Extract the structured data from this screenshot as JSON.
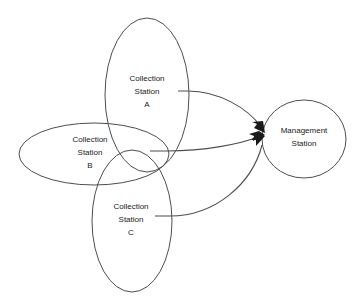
{
  "diagram": {
    "type": "network-topology-diagram",
    "background_color": "#ffffff",
    "stroke_color": "#4d4d4d",
    "arrow_color": "#1a1a1a",
    "text_color": "#1a1a1a",
    "nodes": [
      {
        "id": "collection-station-a",
        "shape": "ellipse",
        "label_line1": "Collection",
        "label_line2": "Station",
        "label_line3": "A",
        "cx": 147,
        "cy": 95,
        "rx": 42,
        "ry": 77
      },
      {
        "id": "collection-station-b",
        "shape": "ellipse",
        "label_line1": "Collection",
        "label_line2": "Station",
        "label_line3": "B",
        "cx": 94,
        "cy": 154,
        "rx": 75,
        "ry": 31
      },
      {
        "id": "collection-station-c",
        "shape": "ellipse",
        "label_line1": "Collection",
        "label_line2": "Station",
        "label_line3": "C",
        "cx": 132,
        "cy": 221,
        "rx": 40,
        "ry": 71
      },
      {
        "id": "management-station",
        "shape": "circle",
        "label_line1": "Management",
        "label_line2": "Station",
        "label_line3": "",
        "cx": 304,
        "cy": 139,
        "rx": 42,
        "ry": 39
      }
    ],
    "edges": [
      {
        "id": "edge-a-to-management",
        "from": "collection-station-a",
        "to": "management-station",
        "arrowhead": "filled-triangle"
      },
      {
        "id": "edge-b-to-management",
        "from": "collection-station-b",
        "to": "management-station",
        "arrowhead": "filled-triangle"
      },
      {
        "id": "edge-c-to-management",
        "from": "collection-station-c",
        "to": "management-station",
        "arrowhead": "filled-triangle"
      }
    ]
  }
}
